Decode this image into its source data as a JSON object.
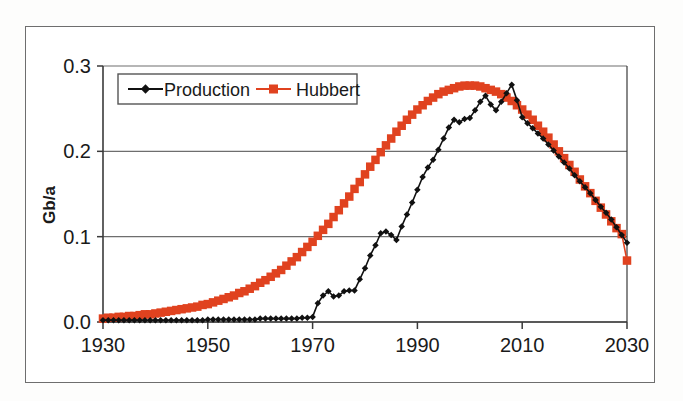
{
  "chart_data": {
    "type": "line",
    "title": "",
    "subtitle": "",
    "xlabel": "",
    "ylabel": "Gb/a",
    "xlim": [
      1930,
      2030
    ],
    "ylim": [
      0.0,
      0.3
    ],
    "xticks": [
      "1930",
      "1950",
      "1970",
      "1990",
      "2010",
      "2030"
    ],
    "xtick_values": [
      1930,
      1950,
      1970,
      1990,
      2010,
      2030
    ],
    "yticks": [
      "0.0",
      "0.1",
      "0.2",
      "0.3"
    ],
    "ytick_values": [
      0.0,
      0.1,
      0.2,
      0.3
    ],
    "grid": "horizontal",
    "legend_position": "top-left-inside",
    "x": [
      1930,
      1931,
      1932,
      1933,
      1934,
      1935,
      1936,
      1937,
      1938,
      1939,
      1940,
      1941,
      1942,
      1943,
      1944,
      1945,
      1946,
      1947,
      1948,
      1949,
      1950,
      1951,
      1952,
      1953,
      1954,
      1955,
      1956,
      1957,
      1958,
      1959,
      1960,
      1961,
      1962,
      1963,
      1964,
      1965,
      1966,
      1967,
      1968,
      1969,
      1970,
      1971,
      1972,
      1973,
      1974,
      1975,
      1976,
      1977,
      1978,
      1979,
      1980,
      1981,
      1982,
      1983,
      1984,
      1985,
      1986,
      1987,
      1988,
      1989,
      1990,
      1991,
      1992,
      1993,
      1994,
      1995,
      1996,
      1997,
      1998,
      1999,
      2000,
      2001,
      2002,
      2003,
      2004,
      2005,
      2006,
      2007,
      2008,
      2009,
      2010,
      2011,
      2012,
      2013,
      2014,
      2015,
      2016,
      2017,
      2018,
      2019,
      2020,
      2021,
      2022,
      2023,
      2024,
      2025,
      2026,
      2027,
      2028,
      2029,
      2030
    ],
    "series": [
      {
        "name": "Production",
        "color": "#111111",
        "marker": "diamond",
        "values": [
          0.002,
          0.002,
          0.002,
          0.002,
          0.002,
          0.002,
          0.002,
          0.002,
          0.002,
          0.002,
          0.002,
          0.002,
          0.002,
          0.002,
          0.002,
          0.002,
          0.002,
          0.002,
          0.002,
          0.002,
          0.003,
          0.003,
          0.003,
          0.003,
          0.003,
          0.003,
          0.003,
          0.003,
          0.003,
          0.003,
          0.004,
          0.004,
          0.004,
          0.004,
          0.004,
          0.004,
          0.004,
          0.004,
          0.005,
          0.005,
          0.006,
          0.022,
          0.031,
          0.036,
          0.03,
          0.031,
          0.036,
          0.037,
          0.037,
          0.05,
          0.063,
          0.078,
          0.09,
          0.104,
          0.106,
          0.102,
          0.096,
          0.112,
          0.126,
          0.14,
          0.155,
          0.17,
          0.181,
          0.19,
          0.202,
          0.215,
          0.228,
          0.237,
          0.234,
          0.238,
          0.239,
          0.248,
          0.258,
          0.265,
          0.255,
          0.248,
          0.258,
          0.268,
          0.278,
          0.26,
          0.24,
          0.233,
          0.227,
          0.221,
          0.215,
          0.208,
          0.201,
          0.194,
          0.187,
          0.18,
          0.172,
          0.165,
          0.158,
          0.151,
          0.143,
          0.135,
          0.128,
          0.12,
          0.111,
          0.102,
          0.093
        ]
      },
      {
        "name": "Hubbert",
        "color": "#e0421f",
        "marker": "square",
        "values": [
          0.004,
          0.005,
          0.005,
          0.006,
          0.006,
          0.007,
          0.007,
          0.008,
          0.009,
          0.009,
          0.01,
          0.011,
          0.012,
          0.013,
          0.014,
          0.015,
          0.016,
          0.017,
          0.018,
          0.02,
          0.021,
          0.023,
          0.025,
          0.027,
          0.029,
          0.031,
          0.034,
          0.036,
          0.039,
          0.042,
          0.046,
          0.049,
          0.053,
          0.057,
          0.061,
          0.066,
          0.071,
          0.076,
          0.082,
          0.088,
          0.094,
          0.101,
          0.108,
          0.115,
          0.123,
          0.131,
          0.139,
          0.147,
          0.156,
          0.164,
          0.173,
          0.182,
          0.19,
          0.199,
          0.207,
          0.215,
          0.223,
          0.23,
          0.237,
          0.243,
          0.249,
          0.254,
          0.259,
          0.263,
          0.267,
          0.27,
          0.272,
          0.274,
          0.276,
          0.277,
          0.277,
          0.277,
          0.276,
          0.274,
          0.272,
          0.27,
          0.267,
          0.263,
          0.259,
          0.254,
          0.249,
          0.243,
          0.237,
          0.23,
          0.223,
          0.216,
          0.208,
          0.2,
          0.192,
          0.184,
          0.176,
          0.167,
          0.159,
          0.151,
          0.142,
          0.134,
          0.126,
          0.118,
          0.11,
          0.103,
          0.072
        ]
      }
    ],
    "legend": [
      {
        "label": "Production",
        "color": "#111111",
        "marker": "diamond"
      },
      {
        "label": "Hubbert",
        "color": "#e0421f",
        "marker": "square"
      }
    ]
  },
  "colors": {
    "production": "#111111",
    "hubbert": "#e0421f",
    "axis": "#3a3a3a",
    "grid": "#6e6e6e",
    "frame": "#6e6e6e",
    "background": "#ffffff"
  }
}
